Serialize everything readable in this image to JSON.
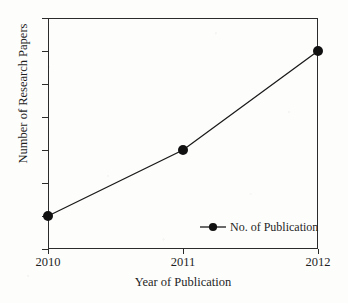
{
  "chart_data": {
    "type": "line",
    "title": "",
    "xlabel": "Year of Publication",
    "ylabel": "Number of Research Papers",
    "categories": [
      "2010",
      "2011",
      "2012"
    ],
    "x": [
      2010,
      2011,
      2012
    ],
    "values": [
      1,
      3,
      6
    ],
    "series": [
      {
        "name": "No. of Publication",
        "values": [
          1,
          3,
          6
        ],
        "marker": "filled-circle",
        "color": "#1a1a1a"
      }
    ],
    "ylim": [
      0,
      7
    ],
    "ytick_labels": [
      "0",
      "1",
      "2",
      "3",
      "4",
      "5",
      "6",
      "7"
    ],
    "ytick_values": [
      0,
      1,
      2,
      3,
      4,
      5,
      6,
      7
    ],
    "xtick_labels": [
      "2010",
      "2011",
      "2012"
    ],
    "grid": false,
    "legend_position": "inside-lower-right",
    "legend_entries": [
      "No. of Publication"
    ]
  },
  "axes": {
    "y_title": "Number of Research Papers",
    "x_title": "Year of Publication"
  },
  "legend": {
    "entry_label": "No. of Publication"
  },
  "colors": {
    "line": "#1a1a1a",
    "marker": "#111111",
    "frame": "#2b2b2b",
    "text": "#1f1f1f",
    "background": "#fdfdfc"
  }
}
